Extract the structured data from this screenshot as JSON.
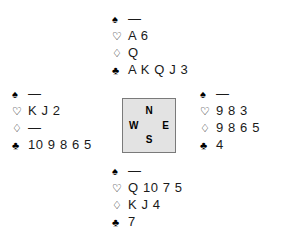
{
  "diagram": {
    "type": "bridge-deal-diagram",
    "background_color": "#ffffff",
    "void_marker": "—",
    "suits": [
      {
        "key": "spades",
        "name": "spade-icon",
        "glyph": "♠",
        "filled": true
      },
      {
        "key": "hearts",
        "name": "heart-icon",
        "glyph": "♡",
        "filled": false
      },
      {
        "key": "diamonds",
        "name": "diamond-icon",
        "glyph": "♢",
        "filled": false
      },
      {
        "key": "clubs",
        "name": "club-icon",
        "glyph": "♣",
        "filled": true
      }
    ]
  },
  "compass": {
    "fill_color": "#e3e3e3",
    "border_color": "#7a7a7a",
    "north": "N",
    "west": "W",
    "east": "E",
    "south": "S"
  },
  "hands": {
    "north": {
      "label": "North",
      "spades": "—",
      "hearts": "A 6",
      "diamonds": "Q",
      "clubs": "A K Q J 3"
    },
    "west": {
      "label": "West",
      "spades": "—",
      "hearts": "K J 2",
      "diamonds": "—",
      "clubs": "10 9 8 6 5"
    },
    "east": {
      "label": "East",
      "spades": "—",
      "hearts": "9 8 3",
      "diamonds": "9 8 6 5",
      "clubs": "4"
    },
    "south": {
      "label": "South",
      "spades": "—",
      "hearts": "Q 10 7 5",
      "diamonds": "K J 4",
      "clubs": "7"
    }
  }
}
